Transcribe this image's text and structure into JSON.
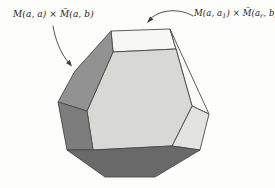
{
  "figure": {
    "background": "#fdfdfc",
    "stroke_color": "#4a4a4a",
    "arrow_color": "#3d3d3d",
    "labels": {
      "left": {
        "parts": [
          {
            "text": "M(a, a) × M̃(a, b)"
          }
        ]
      },
      "right": {
        "parts": [
          {
            "text": "M(a, a"
          },
          {
            "text": "1",
            "sub": true
          },
          {
            "text": ") × M̃(a"
          },
          {
            "text": "r",
            "sub": true
          },
          {
            "text": ", b)"
          }
        ]
      }
    },
    "polyhedron": {
      "faces": [
        {
          "name": "top-square",
          "fill": "#f7f7f4",
          "points": "111,31 170,29 176,49 113,52"
        },
        {
          "name": "right-hexagon",
          "fill": "#fafaf7",
          "points": "170,29 209,114 192,106 176,49"
        },
        {
          "name": "right-small-square",
          "fill": "#e3e3e0",
          "points": "192,106 209,114 200,150 172,146"
        },
        {
          "name": "central-hexagon",
          "fill": "#d8d8d5",
          "points": "113,52 176,49 192,106 172,146 93,150 87,111"
        },
        {
          "name": "upper-left-hexagon",
          "fill": "#929292",
          "points": "75,71 111,31 113,52 87,111 58,102"
        },
        {
          "name": "lower-left-square",
          "fill": "#7d7d7d",
          "points": "58,102 87,111 93,150 67,150"
        },
        {
          "name": "bottom-hexagon",
          "fill": "#696969",
          "points": "67,150 93,150 172,146 200,150 155,177 105,177"
        }
      ]
    },
    "arrows": [
      {
        "name": "arrow-to-top-face",
        "shaft": "M193,16 C182,9 162,8 150,19",
        "head": "147,23 150,16.5 153.5,19.5"
      },
      {
        "name": "arrow-to-left-face",
        "shaft": "M53,26 C55,38 60,53 69,63",
        "head": "72,66.5 66.2,63.2 69.8,59.8"
      }
    ]
  }
}
